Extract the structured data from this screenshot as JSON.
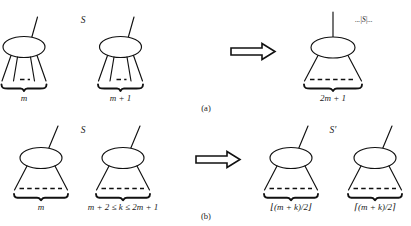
{
  "figure": {
    "type": "tree-transformation-diagram",
    "panels": [
      {
        "id": "a",
        "caption": "(a)",
        "set_label": "S",
        "arrow": "⇒",
        "left_side": [
          {
            "node": "ellipse",
            "leaf_count_label": "m"
          },
          {
            "node": "ellipse",
            "leaf_count_label": "m + 1"
          }
        ],
        "right_side": [
          {
            "node": "ellipse",
            "leaf_count_label": "2m + 1",
            "annotation": "...|S|..."
          }
        ]
      },
      {
        "id": "b",
        "caption": "(b)",
        "set_label": "S",
        "result_set_label": "S′",
        "arrow": "⇒",
        "left_side": [
          {
            "node": "ellipse",
            "leaf_count_label": "m"
          },
          {
            "node": "ellipse",
            "leaf_count_label": "m + 2 ≤ k ≤ 2m + 1"
          }
        ],
        "right_side": [
          {
            "node": "ellipse",
            "leaf_count_label": "⌊(m + k)/2⌋"
          },
          {
            "node": "ellipse",
            "leaf_count_label": "⌈(m + k)/2⌉"
          }
        ]
      }
    ]
  },
  "labels": {
    "panel_a_caption": "(a)",
    "panel_b_caption": "(b)",
    "set_S_top": "S",
    "set_S_bottom": "S",
    "set_S_prime": "S′",
    "cardinality_annotation": "...|S|...",
    "a_left_tree_label": "m",
    "a_mid_tree_label": "m + 1",
    "a_result_tree_label": "2m + 1",
    "b_left_tree_label": "m",
    "b_mid_tree_label": "m + 2 ≤ k ≤ 2m + 1",
    "b_result_left_label": "⌊(m + k)/2⌋",
    "b_result_right_label": "⌈(m + k)/2⌉",
    "arrow_a": "⇒",
    "arrow_b": "⇒"
  },
  "colors": {
    "stroke": "#111111",
    "background": "#ffffff",
    "text": "#1a1a1a"
  }
}
